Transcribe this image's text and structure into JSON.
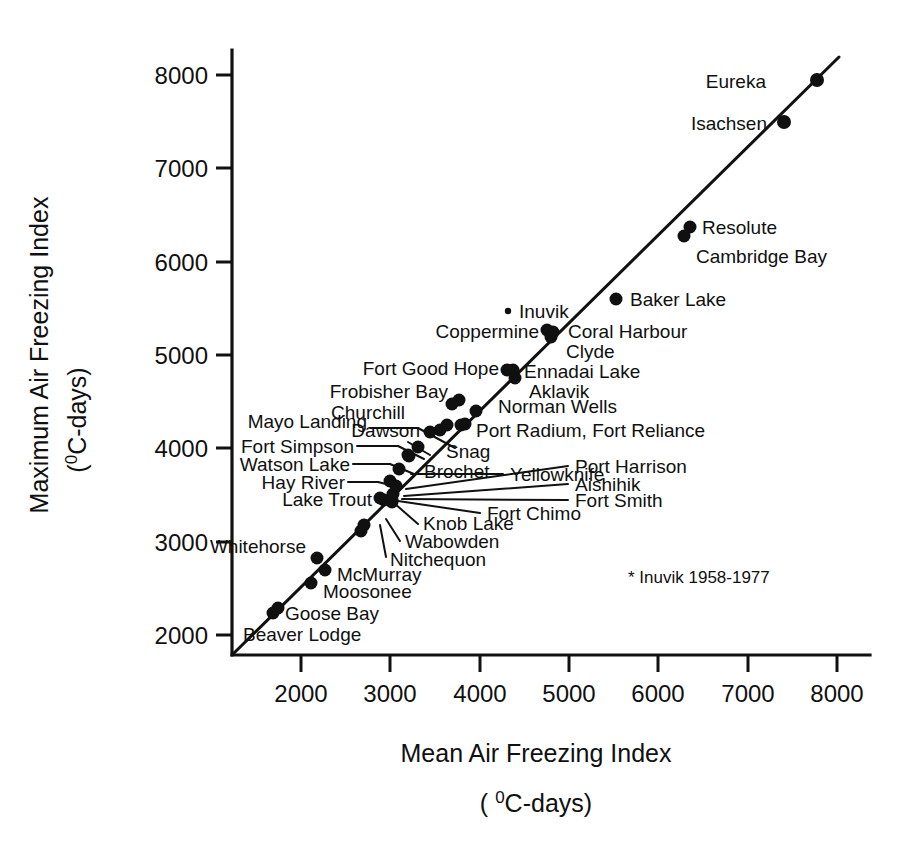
{
  "chart_data": {
    "type": "scatter",
    "title": "",
    "xlabel": "Mean Air Freezing Index",
    "xlabel_units": "(°C-days)",
    "ylabel": "Maximum Air Freezing Index",
    "ylabel_units": "(°C-days)",
    "xlim": [
      1500,
      8400
    ],
    "ylim": [
      1750,
      8400
    ],
    "xticks": [
      2000,
      3000,
      4000,
      5000,
      6000,
      7000,
      8000
    ],
    "yticks": [
      2000,
      3000,
      4000,
      5000,
      6000,
      7000,
      8000
    ],
    "xticklabels": [
      "2000",
      "3000",
      "4000",
      "5000",
      "6000",
      "7000",
      "8000"
    ],
    "yticklabels": [
      "2000",
      "3000",
      "4000",
      "5000",
      "6000",
      "7000",
      "8000"
    ],
    "grid": false,
    "legend": false,
    "reference_line": {
      "label": "1:1 reference line",
      "from": [
        1630,
        1790
      ],
      "to": [
        8400,
        8400
      ]
    },
    "annotations": [
      {
        "text": "* Inuvik 1958-1977",
        "x": 5950,
        "y": 2700
      }
    ],
    "points": [
      {
        "name": "Beaver Lodge",
        "x": 1680,
        "y": 2230,
        "label_pos": "below-right",
        "marker": "dot"
      },
      {
        "name": "Goose Bay",
        "x": 1730,
        "y": 2290,
        "label_pos": "right",
        "marker": "dot"
      },
      {
        "name": "Moosonee",
        "x": 2100,
        "y": 2560,
        "label_pos": "right",
        "marker": "dot"
      },
      {
        "name": "Whitehorse",
        "x": 2160,
        "y": 2830,
        "label_pos": "left",
        "marker": "dot"
      },
      {
        "name": "McMurray",
        "x": 2260,
        "y": 2700,
        "label_pos": "right",
        "marker": "dot"
      },
      {
        "name": "Nitchequon",
        "x": 2660,
        "y": 3120,
        "label_pos": "leader-below",
        "marker": "dot"
      },
      {
        "name": "Wabowden",
        "x": 2700,
        "y": 3180,
        "label_pos": "leader-below",
        "marker": "dot"
      },
      {
        "name": "Knob Lake",
        "x": 2920,
        "y": 3450,
        "label_pos": "leader-below",
        "marker": "dot"
      },
      {
        "name": "Lake Trout",
        "x": 2880,
        "y": 3470,
        "label_pos": "left",
        "marker": "dot"
      },
      {
        "name": "Hay River",
        "x": 2990,
        "y": 3650,
        "label_pos": "leader-left",
        "marker": "dot"
      },
      {
        "name": "Fort Chimo",
        "x": 3010,
        "y": 3430,
        "label_pos": "leader-right",
        "marker": "dot"
      },
      {
        "name": "Fort Smith",
        "x": 3010,
        "y": 3450,
        "label_pos": "leader-right",
        "marker": "dot"
      },
      {
        "name": "Aishihik",
        "x": 3020,
        "y": 3510,
        "label_pos": "leader-right",
        "marker": "dot"
      },
      {
        "name": "Port Harrison",
        "x": 3060,
        "y": 3600,
        "label_pos": "leader-right",
        "marker": "dot"
      },
      {
        "name": "Watson Lake",
        "x": 3090,
        "y": 3780,
        "label_pos": "leader-left",
        "marker": "dot"
      },
      {
        "name": "Brochet",
        "x": 3200,
        "y": 3920,
        "label_pos": "right",
        "marker": "dot"
      },
      {
        "name": "Yellowknife",
        "x": 3190,
        "y": 3930,
        "label_pos": "leader-right",
        "marker": "dot"
      },
      {
        "name": "Fort Simpson",
        "x": 3310,
        "y": 4020,
        "label_pos": "leader-left",
        "marker": "dot"
      },
      {
        "name": "Mayo Landing",
        "x": 3550,
        "y": 4200,
        "label_pos": "leader-left",
        "marker": "dot"
      },
      {
        "name": "Snag",
        "x": 3440,
        "y": 4180,
        "label_pos": "right",
        "marker": "dot"
      },
      {
        "name": "Dawson",
        "x": 3630,
        "y": 4250,
        "label_pos": "left",
        "marker": "dot"
      },
      {
        "name": "Port Radium",
        "x": 3790,
        "y": 4250,
        "label_pos": "right",
        "marker": "dot"
      },
      {
        "name": "Fort Reliance",
        "x": 3830,
        "y": 4260,
        "label_pos": "right",
        "marker": "dot"
      },
      {
        "name": "Churchill",
        "x": 3690,
        "y": 4470,
        "label_pos": "leader-left",
        "marker": "dot"
      },
      {
        "name": "Frobisher Bay",
        "x": 3770,
        "y": 4510,
        "label_pos": "left",
        "marker": "dot"
      },
      {
        "name": "Norman Wells",
        "x": 3960,
        "y": 4390,
        "label_pos": "right",
        "marker": "dot"
      },
      {
        "name": "Aklavik",
        "x": 4400,
        "y": 4750,
        "label_pos": "right",
        "marker": "dot"
      },
      {
        "name": "Ennadai Lake",
        "x": 4370,
        "y": 4840,
        "label_pos": "right",
        "marker": "dot"
      },
      {
        "name": "Fort Good Hope",
        "x": 4310,
        "y": 4840,
        "label_pos": "left",
        "marker": "dot"
      },
      {
        "name": "Clyde",
        "x": 4800,
        "y": 5200,
        "label_pos": "right",
        "marker": "dot"
      },
      {
        "name": "Coral Harbour",
        "x": 4820,
        "y": 5250,
        "label_pos": "right",
        "marker": "dot"
      },
      {
        "name": "Coppermine",
        "x": 4760,
        "y": 5280,
        "label_pos": "left",
        "marker": "dot"
      },
      {
        "name": "Inuvik",
        "x": 4550,
        "y": 5470,
        "label_pos": "right",
        "marker": "tiny"
      },
      {
        "name": "Baker Lake",
        "x": 5280,
        "y": 5600,
        "label_pos": "right",
        "marker": "dot"
      },
      {
        "name": "Cambridge Bay",
        "x": 6040,
        "y": 6280,
        "label_pos": "right",
        "marker": "dot"
      },
      {
        "name": "Resolute",
        "x": 6110,
        "y": 6370,
        "label_pos": "right",
        "marker": "dot"
      },
      {
        "name": "Isachsen",
        "x": 7160,
        "y": 7500,
        "label_pos": "left",
        "marker": "dot"
      },
      {
        "name": "Eureka",
        "x": 7520,
        "y": 7950,
        "label_pos": "left",
        "marker": "dot"
      }
    ],
    "combined_labels": [
      {
        "text": "Port Radium, Fort Reliance",
        "for": [
          "Port Radium",
          "Fort Reliance"
        ]
      }
    ]
  }
}
